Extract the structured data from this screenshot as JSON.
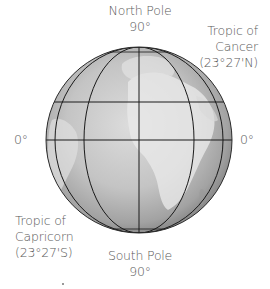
{
  "diagram": {
    "type": "globe-latitude-diagram",
    "labels": {
      "north_pole": {
        "name": "North Pole",
        "degrees": "90°"
      },
      "south_pole": {
        "name": "South Pole",
        "degrees": "90°"
      },
      "tropic_cancer": {
        "line1": "Tropic of",
        "line2": "Cancer",
        "line3": "(23°27'N)"
      },
      "tropic_capricorn": {
        "line1": "Tropic of",
        "line2": "Capricorn",
        "line3": "(23°27'S)"
      },
      "equator_left": "0°",
      "equator_right": "0°"
    },
    "globe": {
      "center": [
        139,
        140
      ],
      "radius": 93,
      "fill_center": "#d6d6d6",
      "fill_edge": "#868686",
      "line_color": "#1a1a1a",
      "latitude_lines_y": [
        102,
        140,
        178
      ],
      "meridian_half_widths": [
        0,
        55,
        84
      ]
    }
  }
}
